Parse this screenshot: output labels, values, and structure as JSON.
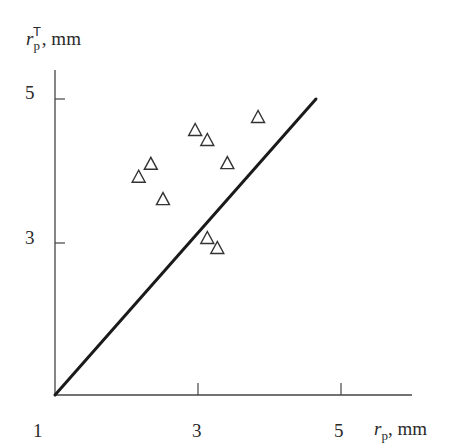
{
  "chart_data": {
    "type": "scatter",
    "title": "",
    "xlabel": "r_p, mm",
    "ylabel": "r_p^T, mm",
    "xlim": [
      1,
      6
    ],
    "ylim": [
      1,
      5.3
    ],
    "x_ticks": [
      "1",
      "3",
      "5"
    ],
    "y_ticks": [
      "3",
      "5"
    ],
    "grid": false,
    "legend": null,
    "marker": "open-triangle",
    "series": [
      {
        "name": "measurements",
        "x": [
          3.84,
          2.96,
          3.13,
          2.34,
          3.41,
          2.17,
          2.51,
          3.13,
          3.27
        ],
        "y": [
          4.75,
          4.57,
          4.43,
          4.1,
          4.11,
          3.92,
          3.61,
          3.07,
          2.93
        ]
      }
    ],
    "reference_line": {
      "x": [
        1.0,
        4.65
      ],
      "y": [
        1.0,
        5.0
      ],
      "style": "solid-thick"
    }
  },
  "labels": {
    "y_axis_main": "r",
    "y_axis_sub": "p",
    "y_axis_sup": "T",
    "y_axis_unit": ", mm",
    "x_axis_main": "r",
    "x_axis_sub": "p",
    "x_axis_unit": ", mm",
    "x_tick_1": "1",
    "x_tick_3": "3",
    "x_tick_5": "5",
    "y_tick_3": "3",
    "y_tick_5": "5"
  }
}
